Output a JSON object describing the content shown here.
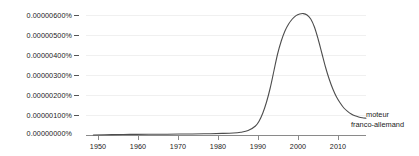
{
  "chart_data": {
    "type": "line",
    "title": "",
    "subtitle": "",
    "xlabel": "",
    "ylabel": "",
    "grid": true,
    "legend_position": "right-inline",
    "xlim": [
      1943,
      2019
    ],
    "ylim": [
      0,
      6.5e-06
    ],
    "x_ticks": [
      1950,
      1960,
      1970,
      1980,
      1990,
      2000,
      2010
    ],
    "x_tick_labels": [
      "1950",
      "1960",
      "1970",
      "1980",
      "1990",
      "2000",
      "2010"
    ],
    "y_ticks": [
      0.0,
      1e-06,
      2e-06,
      3e-06,
      4e-06,
      5e-06,
      6e-06
    ],
    "y_tick_labels": [
      "0.00000000%",
      "0.00000100%",
      "0.00000200%",
      "0.00000300%",
      "0.00000400%",
      "0.00000500%",
      "0.00000600%"
    ],
    "series": [
      {
        "name": "moteur franco-allemand",
        "color": "#4d4d4d",
        "label_lines": [
          "moteur",
          "franco-allemand"
        ],
        "x": [
          1945,
          1950,
          1955,
          1960,
          1965,
          1970,
          1975,
          1980,
          1983,
          1985,
          1987,
          1989,
          1990,
          1991,
          1992,
          1993,
          1994,
          1995,
          1996,
          1997,
          1998,
          1999,
          2000,
          2001,
          2002,
          2003,
          2004,
          2005,
          2006,
          2007,
          2008,
          2009,
          2010,
          2011,
          2012,
          2013,
          2014,
          2015,
          2016,
          2017,
          2018,
          2019
        ],
        "values": [
          0.0,
          2e-08,
          3e-08,
          4e-08,
          4e-08,
          5e-08,
          6e-08,
          8e-08,
          1e-07,
          1.4e-07,
          2.2e-07,
          4.5e-07,
          7e-07,
          1.1e-06,
          1.65e-06,
          2.35e-06,
          3.2e-06,
          4.05e-06,
          4.7e-06,
          5.2e-06,
          5.55e-06,
          5.8e-06,
          5.97e-06,
          6.05e-06,
          6.07e-06,
          6e-06,
          5.8e-06,
          5.4e-06,
          4.8e-06,
          4.1e-06,
          3.4e-06,
          2.8e-06,
          2.3e-06,
          1.9e-06,
          1.6e-06,
          1.35e-06,
          1.18e-06,
          1.05e-06,
          9.6e-07,
          9e-07,
          8.6e-07,
          8.4e-07
        ]
      }
    ],
    "peak": {
      "year": 2002,
      "value": 6.07e-06
    }
  },
  "colors": {
    "curve": "#4d4d4d",
    "gridline": "#f0f0f0",
    "axis": "#8a8a8a",
    "text": "#1a1a1a",
    "background": "#ffffff"
  }
}
